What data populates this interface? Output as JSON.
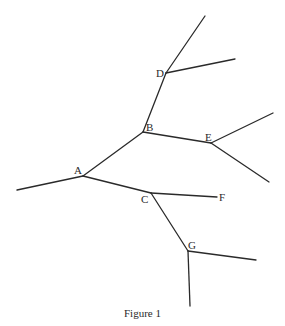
{
  "figure": {
    "caption": "Figure 1",
    "line_color": "#2a2a2a",
    "background": "#ffffff"
  },
  "nodes": [
    {
      "id": "A",
      "label": "A",
      "x": 83,
      "y": 176,
      "label_x": 74,
      "label_y": 174
    },
    {
      "id": "B",
      "label": "B",
      "x": 143,
      "y": 132,
      "label_x": 146,
      "label_y": 131
    },
    {
      "id": "C",
      "label": "C",
      "x": 151,
      "y": 193,
      "label_x": 141,
      "label_y": 203
    },
    {
      "id": "D",
      "label": "D",
      "x": 166,
      "y": 73,
      "label_x": 156,
      "label_y": 77
    },
    {
      "id": "E",
      "label": "E",
      "x": 211,
      "y": 143,
      "label_x": 205,
      "label_y": 141
    },
    {
      "id": "F",
      "label": "F",
      "x": 217,
      "y": 197,
      "label_x": 219,
      "label_y": 201
    },
    {
      "id": "G",
      "label": "G",
      "x": 188,
      "y": 251,
      "label_x": 188,
      "label_y": 249
    }
  ],
  "edges": [
    {
      "from": "leaf-A-left",
      "to": "A",
      "x1": 17,
      "y1": 190,
      "x2": 83,
      "y2": 176
    },
    {
      "from": "A",
      "to": "B",
      "x1": 83,
      "y1": 176,
      "x2": 143,
      "y2": 132
    },
    {
      "from": "A",
      "to": "C",
      "x1": 83,
      "y1": 176,
      "x2": 151,
      "y2": 193
    },
    {
      "from": "B",
      "to": "D",
      "x1": 143,
      "y1": 132,
      "x2": 166,
      "y2": 73
    },
    {
      "from": "B",
      "to": "E",
      "x1": 143,
      "y1": 132,
      "x2": 211,
      "y2": 143
    },
    {
      "from": "D",
      "to": "leaf-D-top",
      "x1": 166,
      "y1": 73,
      "x2": 205,
      "y2": 16
    },
    {
      "from": "D",
      "to": "leaf-D-right",
      "x1": 166,
      "y1": 73,
      "x2": 235,
      "y2": 59
    },
    {
      "from": "E",
      "to": "leaf-E-upper",
      "x1": 211,
      "y1": 143,
      "x2": 273,
      "y2": 113
    },
    {
      "from": "E",
      "to": "leaf-E-lower",
      "x1": 211,
      "y1": 143,
      "x2": 269,
      "y2": 182
    },
    {
      "from": "C",
      "to": "F",
      "x1": 151,
      "y1": 193,
      "x2": 217,
      "y2": 197
    },
    {
      "from": "C",
      "to": "G",
      "x1": 151,
      "y1": 193,
      "x2": 188,
      "y2": 251
    },
    {
      "from": "G",
      "to": "leaf-G-right",
      "x1": 188,
      "y1": 251,
      "x2": 256,
      "y2": 260
    },
    {
      "from": "G",
      "to": "leaf-G-bottom",
      "x1": 188,
      "y1": 251,
      "x2": 190,
      "y2": 306
    }
  ]
}
